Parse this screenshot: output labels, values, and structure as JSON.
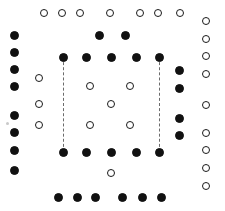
{
  "figure": {
    "canvas": {
      "width": 225,
      "height": 211,
      "background": "#ffffff"
    },
    "marker_styles": {
      "filled_color": "#111111",
      "open_fill": "#ffffff",
      "open_stroke": "#1a1a1a",
      "dash_color": "#6b6b6b",
      "filled_diameter": 9,
      "open_diameter": 8
    },
    "legend": {
      "filled_label": "filled dot",
      "open_label": "open dot",
      "dashed_label": "dashed connector"
    }
  },
  "chart_data": {
    "type": "scatter",
    "xlabel": "",
    "ylabel": "",
    "xlim": [
      0,
      225
    ],
    "ylim": [
      0,
      211
    ],
    "grid": false,
    "legend_position": "none",
    "series": [
      {
        "name": "filled dots",
        "marker": "filled",
        "color": "#111111",
        "size": 9,
        "points": [
          {
            "group": "left-outer-column",
            "x": 14,
            "y": 35
          },
          {
            "group": "left-outer-column",
            "x": 14,
            "y": 52
          },
          {
            "group": "left-outer-column",
            "x": 14,
            "y": 69
          },
          {
            "group": "left-outer-column",
            "x": 14,
            "y": 86
          },
          {
            "group": "left-outer-column",
            "x": 14,
            "y": 115
          },
          {
            "group": "left-outer-column",
            "x": 14,
            "y": 132
          },
          {
            "group": "left-outer-column",
            "x": 14,
            "y": 150
          },
          {
            "group": "left-outer-column",
            "x": 14,
            "y": 170
          },
          {
            "group": "upper-middle-pair",
            "x": 99,
            "y": 35
          },
          {
            "group": "upper-middle-pair",
            "x": 125,
            "y": 35
          },
          {
            "group": "inner-top-row",
            "x": 63,
            "y": 57
          },
          {
            "group": "inner-top-row",
            "x": 86,
            "y": 57
          },
          {
            "group": "inner-top-row",
            "x": 111,
            "y": 57
          },
          {
            "group": "inner-top-row",
            "x": 136,
            "y": 57
          },
          {
            "group": "inner-top-row",
            "x": 159,
            "y": 57
          },
          {
            "group": "right-inner-column",
            "x": 179,
            "y": 70
          },
          {
            "group": "right-inner-column",
            "x": 179,
            "y": 88
          },
          {
            "group": "right-inner-column",
            "x": 179,
            "y": 118
          },
          {
            "group": "right-inner-column",
            "x": 179,
            "y": 135
          },
          {
            "group": "inner-bottom-row",
            "x": 63,
            "y": 152
          },
          {
            "group": "inner-bottom-row",
            "x": 86,
            "y": 152
          },
          {
            "group": "inner-bottom-row",
            "x": 111,
            "y": 152
          },
          {
            "group": "inner-bottom-row",
            "x": 136,
            "y": 152
          },
          {
            "group": "inner-bottom-row",
            "x": 159,
            "y": 152
          },
          {
            "group": "bottom-outer-row",
            "x": 58,
            "y": 197
          },
          {
            "group": "bottom-outer-row",
            "x": 77,
            "y": 197
          },
          {
            "group": "bottom-outer-row",
            "x": 95,
            "y": 197
          },
          {
            "group": "bottom-outer-row",
            "x": 122,
            "y": 197
          },
          {
            "group": "bottom-outer-row",
            "x": 142,
            "y": 197
          },
          {
            "group": "bottom-outer-row",
            "x": 161,
            "y": 197
          }
        ]
      },
      {
        "name": "open dots",
        "marker": "open",
        "color": "#1a1a1a",
        "size": 8,
        "points": [
          {
            "group": "top-outer-row",
            "x": 44,
            "y": 13
          },
          {
            "group": "top-outer-row",
            "x": 62,
            "y": 13
          },
          {
            "group": "top-outer-row",
            "x": 80,
            "y": 13
          },
          {
            "group": "top-outer-row",
            "x": 110,
            "y": 13
          },
          {
            "group": "top-outer-row",
            "x": 140,
            "y": 13
          },
          {
            "group": "top-outer-row",
            "x": 158,
            "y": 13
          },
          {
            "group": "top-outer-row",
            "x": 180,
            "y": 13
          },
          {
            "group": "right-outer-column",
            "x": 206,
            "y": 21
          },
          {
            "group": "right-outer-column",
            "x": 206,
            "y": 39
          },
          {
            "group": "right-outer-column",
            "x": 206,
            "y": 56
          },
          {
            "group": "right-outer-column",
            "x": 206,
            "y": 74
          },
          {
            "group": "right-outer-column",
            "x": 206,
            "y": 105
          },
          {
            "group": "right-outer-column",
            "x": 206,
            "y": 133
          },
          {
            "group": "right-outer-column",
            "x": 206,
            "y": 150
          },
          {
            "group": "right-outer-column",
            "x": 206,
            "y": 168
          },
          {
            "group": "right-outer-column",
            "x": 206,
            "y": 186
          },
          {
            "group": "left-inner-column",
            "x": 39,
            "y": 78
          },
          {
            "group": "left-inner-column",
            "x": 39,
            "y": 104
          },
          {
            "group": "left-inner-column",
            "x": 39,
            "y": 125
          },
          {
            "group": "core-quincunx",
            "x": 90,
            "y": 86
          },
          {
            "group": "core-quincunx",
            "x": 130,
            "y": 86
          },
          {
            "group": "core-quincunx",
            "x": 111,
            "y": 104
          },
          {
            "group": "core-quincunx",
            "x": 90,
            "y": 125
          },
          {
            "group": "core-quincunx",
            "x": 130,
            "y": 125
          },
          {
            "group": "below-inner-square",
            "x": 111,
            "y": 173
          }
        ]
      }
    ],
    "connectors": [
      {
        "name": "left-dashed-line",
        "x": 63,
        "y_start": 57,
        "y_end": 152,
        "style": "dashed",
        "color": "#6b6b6b"
      },
      {
        "name": "right-dashed-line",
        "x": 159,
        "y_start": 57,
        "y_end": 152,
        "style": "dashed",
        "color": "#6b6b6b"
      }
    ]
  }
}
